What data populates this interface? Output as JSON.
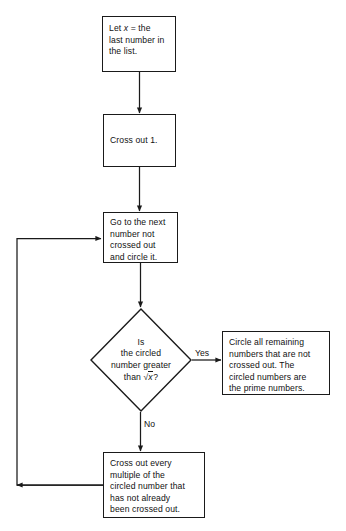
{
  "diagram": {
    "type": "flowchart",
    "stroke_color": "#1a1a1a",
    "background_color": "#ffffff",
    "text_color": "#111111"
  },
  "nodes": {
    "start": {
      "shape": "process",
      "line1": "Let",
      "var": "x",
      "line1b": "= the",
      "line2": "last number in",
      "line3": "the list."
    },
    "cross_out_one": {
      "shape": "process",
      "text": "Cross out 1."
    },
    "next_number": {
      "shape": "process",
      "line1": "Go to the next",
      "line2": "number not",
      "line3": "crossed out",
      "line4": "and circle it."
    },
    "decision": {
      "shape": "diamond",
      "line1": "Is",
      "line2": "the circled",
      "line3": "number greater",
      "line4_prefix": "than",
      "radical_symbol": "√",
      "radicand": "x",
      "line4_suffix": "?"
    },
    "result": {
      "shape": "process",
      "line1": "Circle all remaining",
      "line2": "numbers that are not",
      "line3": "crossed out. The",
      "line4": "circled numbers are",
      "line5": "the prime numbers."
    },
    "cross_multiples": {
      "shape": "process",
      "line1": "Cross out every",
      "line2": "multiple of the",
      "line3": "circled number that",
      "line4": "has not already",
      "line5": "been crossed out."
    }
  },
  "edge_labels": {
    "yes": "Yes",
    "no": "No"
  }
}
